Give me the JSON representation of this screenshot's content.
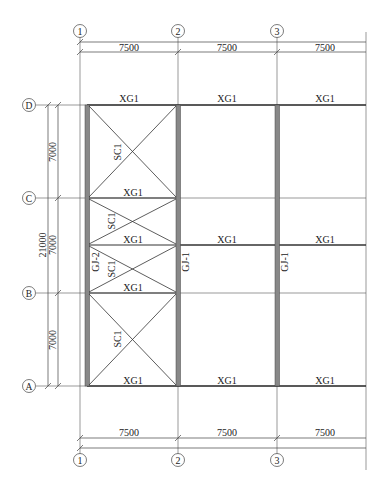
{
  "drawing": {
    "grid_x": [
      {
        "label": "1",
        "x": 80
      },
      {
        "label": "2",
        "x": 178
      },
      {
        "label": "3",
        "x": 277
      }
    ],
    "grid_y": [
      {
        "label": "D",
        "y": 105
      },
      {
        "label": "C",
        "y": 198
      },
      {
        "label": "B",
        "y": 293
      },
      {
        "label": "A",
        "y": 386
      }
    ],
    "top_dimensions": [
      "7500",
      "7500",
      "7500"
    ],
    "bottom_dimensions": [
      "7500",
      "7500",
      "7500"
    ],
    "left_dimensions": {
      "segments": [
        "7000",
        "7000",
        "7000"
      ],
      "total": "21000"
    },
    "beam_labels": {
      "row_D": [
        "XG1",
        "XG1",
        "XG1"
      ],
      "row_C": "XG1",
      "row_mid": [
        "XG1",
        "XG1",
        "XG1"
      ],
      "row_B": "XG1",
      "row_A": [
        "XG1",
        "XG1",
        "XG1"
      ]
    },
    "bracing_labels": [
      "SC1",
      "SC1",
      "SC1",
      "SC1"
    ],
    "frame_labels": {
      "left": "GJ-2",
      "col2": "GJ-1",
      "col3": "GJ-1"
    }
  }
}
